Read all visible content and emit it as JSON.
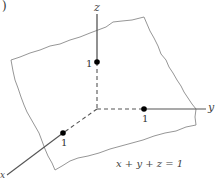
{
  "figure": {
    "panel_label": ")",
    "axes": {
      "x": {
        "label": "x",
        "tick": "1"
      },
      "y": {
        "label": "y",
        "tick": "1"
      },
      "z": {
        "label": "z",
        "tick": "1"
      }
    },
    "equation": "x + y + z = 1",
    "colors": {
      "axis": "#555555",
      "plane_edge": "#8a8a8a",
      "point": "#000000",
      "text": "#444444"
    }
  }
}
